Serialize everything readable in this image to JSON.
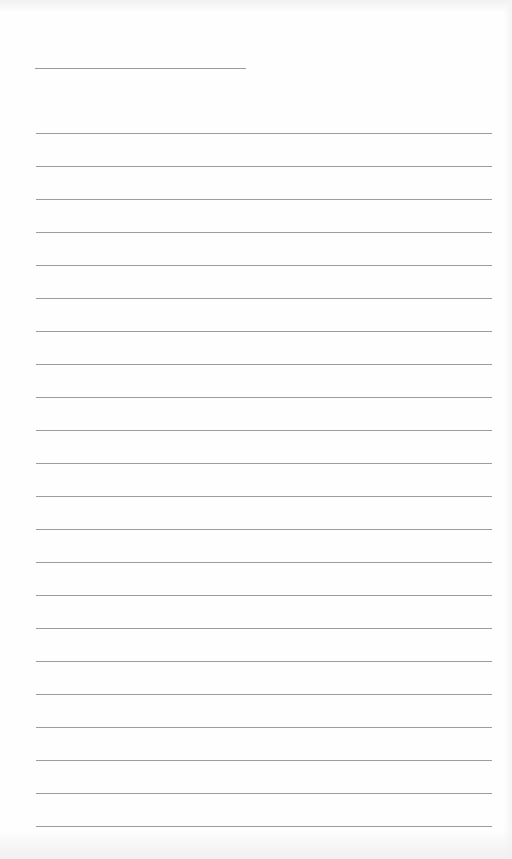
{
  "page": {
    "type": "lined-paper",
    "background": "#fefefe",
    "line_color": "#9c9c9c"
  },
  "title_line": {
    "x1": 35,
    "x2": 246,
    "y": 68
  },
  "ruled_lines": {
    "count": 22,
    "x1": 36,
    "x2": 492,
    "first_y": 133,
    "spacing": 33
  }
}
